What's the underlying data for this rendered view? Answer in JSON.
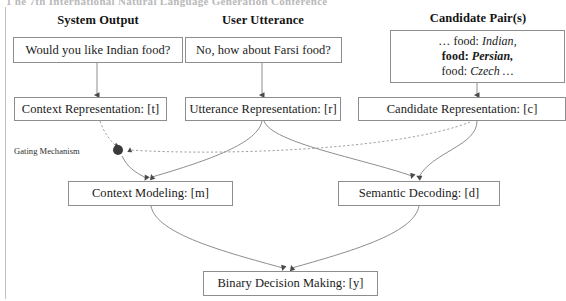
{
  "page": {
    "cropped_header_text": "1 he 7th International Natural Language Generation Conference",
    "width": 566,
    "height": 301,
    "line_color": "#8d8d8d",
    "dashed_color": "#a0a0a0",
    "gate_color": "#3b3b3b"
  },
  "columns": [
    {
      "id": "system-output",
      "label": "System Output"
    },
    {
      "id": "user-utterance",
      "label": "User Utterance"
    },
    {
      "id": "candidate-pairs",
      "label": "Candidate Pair(s)"
    }
  ],
  "nodes": {
    "system_output": {
      "label": "Would you like Indian food?"
    },
    "user_utterance": {
      "label": "No, how about Farsi food?"
    },
    "candidate_pairs": {
      "lines": [
        {
          "prefix": "… food: ",
          "value": "Indian,",
          "bold_prefix": false
        },
        {
          "prefix": "food: ",
          "value": "Persian,",
          "bold_prefix": true
        },
        {
          "prefix": "food: ",
          "value": "Czech …",
          "bold_prefix": false
        }
      ]
    },
    "context_representation": {
      "label": "Context Representation: [t]"
    },
    "utterance_representation": {
      "label": "Utterance Representation: [r]"
    },
    "candidate_representation": {
      "label": "Candidate Representation: [c]"
    },
    "context_modeling": {
      "label": "Context Modeling: [m]"
    },
    "semantic_decoding": {
      "label": "Semantic Decoding: [d]"
    },
    "binary_decision": {
      "label": "Binary Decision Making: [y]"
    },
    "gating_mechanism": {
      "label": "Gating Mechanism"
    }
  },
  "edges": [
    {
      "from": "system_output",
      "to": "context_representation",
      "style": "solid"
    },
    {
      "from": "user_utterance",
      "to": "utterance_representation",
      "style": "solid"
    },
    {
      "from": "candidate_pairs",
      "to": "candidate_representation",
      "style": "solid"
    },
    {
      "from": "context_representation",
      "to": "gating_mechanism",
      "style": "dashed"
    },
    {
      "from": "candidate_representation",
      "to": "gating_mechanism",
      "style": "dashed"
    },
    {
      "from": "gating_mechanism",
      "to": "context_modeling",
      "style": "solid"
    },
    {
      "from": "utterance_representation",
      "to": "context_modeling",
      "style": "solid"
    },
    {
      "from": "utterance_representation",
      "to": "semantic_decoding",
      "style": "solid"
    },
    {
      "from": "candidate_representation",
      "to": "semantic_decoding",
      "style": "solid"
    },
    {
      "from": "context_modeling",
      "to": "binary_decision",
      "style": "solid"
    },
    {
      "from": "semantic_decoding",
      "to": "binary_decision",
      "style": "solid"
    }
  ]
}
